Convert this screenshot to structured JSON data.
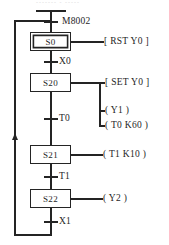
{
  "diagram": {
    "type": "sequential-function-chart",
    "line_color": "#242424",
    "background": "#ffffff"
  },
  "top": {
    "initial_pulse_label": "M8002"
  },
  "steps": [
    {
      "id": "S0",
      "label": "S0",
      "initial": true,
      "actions": [
        {
          "kind": "bracket",
          "text": "[ RST    Y0 ]",
          "operator": "RST",
          "operand": "Y0"
        }
      ],
      "transition_below": "X0"
    },
    {
      "id": "S20",
      "label": "S20",
      "initial": false,
      "actions": [
        {
          "kind": "bracket",
          "text": "[ SET    Y0 ]",
          "operator": "SET",
          "operand": "Y0"
        },
        {
          "kind": "coil",
          "text": "( Y1 )",
          "operator": "",
          "operand": "Y1"
        },
        {
          "kind": "timer",
          "text": "( T0    K60 )",
          "operator": "T0",
          "operand": "K60"
        }
      ],
      "transition_below": "T0"
    },
    {
      "id": "S21",
      "label": "S21",
      "initial": false,
      "actions": [
        {
          "kind": "timer",
          "text": "( T1    K10 )",
          "operator": "T1",
          "operand": "K10"
        }
      ],
      "transition_below": "T1"
    },
    {
      "id": "S22",
      "label": "S22",
      "initial": false,
      "actions": [
        {
          "kind": "coil",
          "text": "( Y2 )",
          "operator": "",
          "operand": "Y2"
        }
      ],
      "transition_below": "X1"
    }
  ],
  "return_branch": {
    "direction": "up",
    "from_step": "S22",
    "to_step": "S0",
    "arrow": "arrow-up"
  },
  "artifacts": {
    "top_clipped_text": "-------  -  -----"
  }
}
